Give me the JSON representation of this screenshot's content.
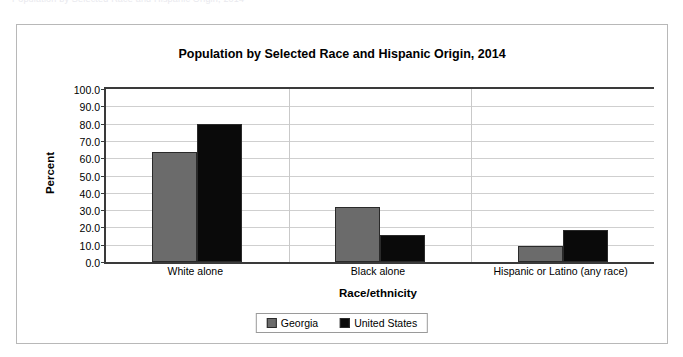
{
  "top_strip": {
    "faint_text": "Population by Selected Race and Hispanic Origin, 2014"
  },
  "chart_data": {
    "type": "bar",
    "title": "Population by Selected Race and Hispanic Origin, 2014",
    "xlabel": "Race/ethnicity",
    "ylabel": "Percent",
    "categories": [
      "White alone",
      "Black alone",
      "Hispanic or Latino (any race)"
    ],
    "series": [
      {
        "name": "Georgia",
        "color": "#6b6b6b",
        "values": [
          63.8,
          31.7,
          9.4
        ]
      },
      {
        "name": "United States",
        "color": "#0a0a0a",
        "values": [
          79.6,
          15.9,
          18.5
        ]
      }
    ],
    "ylim": [
      0,
      100
    ],
    "ytick_step": 10,
    "ytick_labels": [
      "0.0",
      "10.0",
      "20.0",
      "30.0",
      "40.0",
      "50.0",
      "60.0",
      "70.0",
      "80.0",
      "90.0",
      "100.0"
    ],
    "grid": true,
    "legend_position": "bottom"
  }
}
